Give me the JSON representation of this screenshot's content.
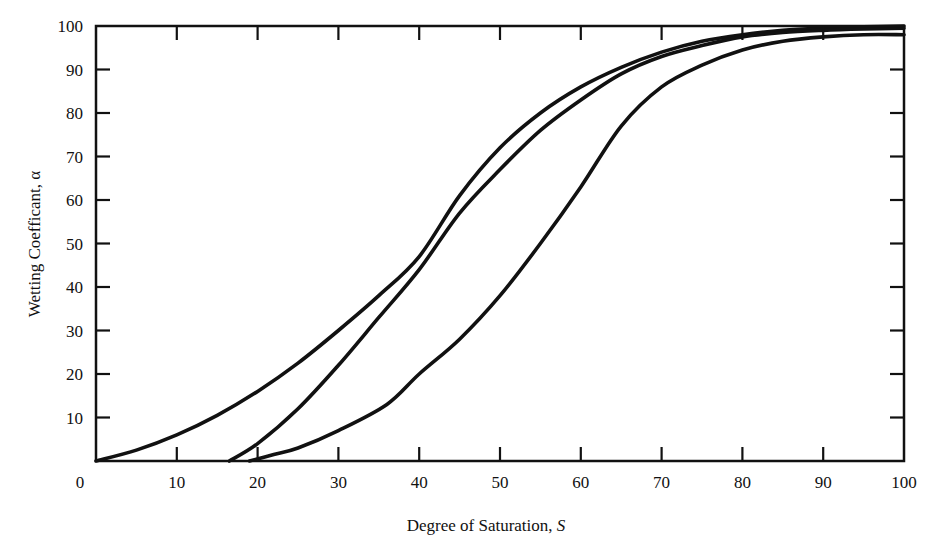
{
  "chart_data": {
    "type": "line",
    "title": "",
    "xlabel": "Degree of Saturation, S",
    "ylabel": "Wetting Coefficant, α",
    "xlim": [
      0,
      100
    ],
    "ylim": [
      0,
      100
    ],
    "grid": false,
    "legend": null,
    "x_ticks": [
      0,
      10,
      20,
      30,
      40,
      50,
      60,
      70,
      80,
      90,
      100
    ],
    "y_ticks": [
      10,
      20,
      30,
      40,
      50,
      60,
      70,
      80,
      90,
      100
    ],
    "series": [
      {
        "name": "Curve 1 (left)",
        "x": [
          0,
          5,
          10,
          15,
          20,
          25,
          30,
          35,
          40,
          45,
          50,
          55,
          60,
          65,
          70,
          75,
          80,
          85,
          90,
          95,
          100
        ],
        "y": [
          0,
          2.5,
          6,
          10.5,
          16,
          22.5,
          30,
          38,
          47,
          61,
          72,
          80,
          86,
          90.5,
          94,
          96.5,
          98,
          99,
          99.5,
          99.8,
          100
        ]
      },
      {
        "name": "Curve 2 (middle)",
        "x": [
          16.5,
          20,
          25,
          30,
          35,
          40,
          45,
          50,
          55,
          60,
          65,
          70,
          75,
          80,
          85,
          90,
          95,
          100
        ],
        "y": [
          0,
          4,
          12,
          22,
          33,
          44,
          57,
          67,
          76,
          83,
          89,
          93,
          95.5,
          97.5,
          98.5,
          99,
          99.3,
          99.5
        ]
      },
      {
        "name": "Curve 3 (right)",
        "x": [
          19,
          22,
          25,
          30,
          36,
          40,
          45,
          50,
          55,
          60,
          65,
          70,
          75,
          80,
          85,
          90,
          95,
          100
        ],
        "y": [
          0,
          1.5,
          3,
          7,
          13,
          20,
          28,
          38,
          50,
          63,
          77,
          86,
          91,
          94.5,
          96.5,
          97.5,
          98,
          98
        ]
      }
    ]
  },
  "axes": {
    "x_title": "Degree of Saturation, S",
    "x_title_main": "Degree of Saturation, ",
    "x_title_var": "S",
    "y_title": "Wetting Coefficant, α"
  },
  "colors": {
    "line": "#111111",
    "background": "#ffffff"
  }
}
